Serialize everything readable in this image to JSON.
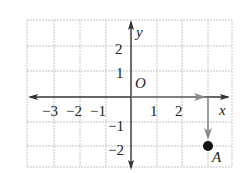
{
  "diagram": {
    "type": "coordinate-plane",
    "axes": {
      "x_label": "x",
      "y_label": "y",
      "origin_label": "O"
    },
    "x_ticks": [
      {
        "value": -3,
        "label": "−3"
      },
      {
        "value": -2,
        "label": "−2"
      },
      {
        "value": -1,
        "label": "−1"
      },
      {
        "value": 1,
        "label": "1"
      },
      {
        "value": 2,
        "label": "2"
      }
    ],
    "y_ticks": [
      {
        "value": 2,
        "label": "2"
      },
      {
        "value": 1,
        "label": "1"
      },
      {
        "value": -1,
        "label": "−1"
      },
      {
        "value": -2,
        "label": "−2"
      }
    ],
    "grid": {
      "x_min": -4,
      "x_max": 4,
      "y_min": -3,
      "y_max": 3
    },
    "translation_arrows": [
      {
        "from": [
          0,
          0
        ],
        "to": [
          3,
          0
        ],
        "direction": "right"
      },
      {
        "from": [
          3,
          0
        ],
        "to": [
          3,
          -2
        ],
        "direction": "down"
      }
    ],
    "point": {
      "label": "A",
      "coords": [
        3,
        -2
      ]
    },
    "colors": {
      "grid": "#bbbbbb",
      "axes": "#333333",
      "arrows": "#888888",
      "point": "#111111"
    }
  }
}
